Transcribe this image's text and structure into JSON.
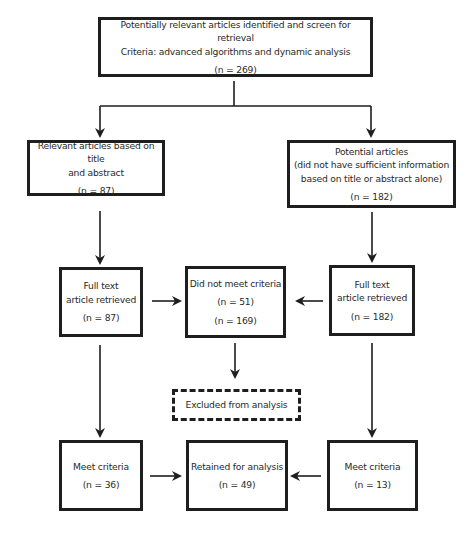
{
  "diagram": {
    "type": "flowchart",
    "nodes": {
      "identified": {
        "line1": "Potentially relevant articles identified and screen for retrieval",
        "line2": "Criteria: advanced algorithms and dynamic analysis",
        "count": "(n = 269)"
      },
      "relevant": {
        "line1": "Relevant articles based on title",
        "line2": "and abstract",
        "count": "(n = 87)"
      },
      "potential": {
        "line1": "Potential articles",
        "line2": "(did not have sufficient information",
        "line3": "based on title or abstract alone)",
        "count": "(n = 182)"
      },
      "fulltext_left": {
        "line1": "Full text",
        "line2": "article retrieved",
        "count": "(n = 87)"
      },
      "not_meet": {
        "line1": "Did not meet criteria",
        "count1": "(n = 51)",
        "count2": "(n = 169)"
      },
      "fulltext_right": {
        "line1": "Full text",
        "line2": "article retrieved",
        "count": "(n = 182)"
      },
      "excluded": {
        "line1": "Excluded from analysis"
      },
      "meet_left": {
        "line1": "Meet criteria",
        "count": "(n = 36)"
      },
      "retained": {
        "line1": "Retained for analysis",
        "count": "(n = 49)"
      },
      "meet_right": {
        "line1": "Meet criteria",
        "count": "(n = 13)"
      }
    },
    "edges": [
      [
        "identified",
        "relevant"
      ],
      [
        "identified",
        "potential"
      ],
      [
        "relevant",
        "fulltext_left"
      ],
      [
        "potential",
        "fulltext_right"
      ],
      [
        "fulltext_left",
        "not_meet"
      ],
      [
        "fulltext_right",
        "not_meet"
      ],
      [
        "not_meet",
        "excluded"
      ],
      [
        "fulltext_left",
        "meet_left"
      ],
      [
        "fulltext_right",
        "meet_right"
      ],
      [
        "meet_left",
        "retained"
      ],
      [
        "meet_right",
        "retained"
      ]
    ]
  }
}
